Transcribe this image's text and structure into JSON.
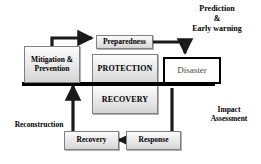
{
  "diagram": {
    "colors": {
      "bar": "#000000",
      "box_border": "#808080",
      "box_fill_light": "#fdfdfd",
      "box_fill_dark": "#d4d4d4",
      "disaster_border": "#000000",
      "disaster_fill": "#ffffff",
      "text": "#000000",
      "arrow": "#1a1a1a",
      "background": "#ffffff"
    },
    "nodes": {
      "mitigation": {
        "label": "Mitigation\n&\nPrevention",
        "style": "gray"
      },
      "preparedness": {
        "label": "Preparedness",
        "style": "gray"
      },
      "protection": {
        "label": "PROTECTION",
        "style": "gray"
      },
      "recovery_center": {
        "label": "RECOVERY",
        "style": "gray"
      },
      "disaster": {
        "label": "Disaster",
        "style": "white"
      },
      "recovery": {
        "label": "Recovery",
        "style": "gray"
      },
      "response": {
        "label": "Response",
        "style": "gray"
      }
    },
    "labels": {
      "prediction": "Prediction\n&\nEarly warning",
      "impact": "Impact\nAssessment",
      "reconstruction": "Reconstruction"
    }
  }
}
